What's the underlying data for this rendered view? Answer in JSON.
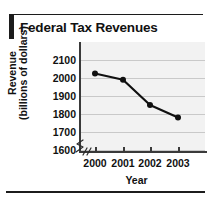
{
  "figure": {
    "title": "Federal Tax Revenues"
  },
  "chart_data": {
    "type": "line",
    "title": "Federal Tax Revenues",
    "xlabel": "Year",
    "ylabel": "Revenue (billions of dollars)",
    "ylabel_lines": [
      "Revenue",
      "(billions of dollars)"
    ],
    "categories": [
      "2000",
      "2001",
      "2002",
      "2003"
    ],
    "x": [
      2000,
      2001,
      2002,
      2003
    ],
    "values": [
      2025,
      1990,
      1850,
      1780
    ],
    "series": [
      {
        "name": "Federal Tax Revenues",
        "values": [
          2025,
          1990,
          1850,
          1780
        ]
      }
    ],
    "yticks": [
      1600,
      1700,
      1800,
      1900,
      2000,
      2100
    ],
    "ylim": [
      1550,
      2150
    ],
    "xlim": [
      1999.5,
      2003.5
    ],
    "grid": true,
    "grid_axis": "y",
    "legend": "none",
    "axis_break": "y-axis broken below 1600",
    "marker": "filled-circle",
    "line_color": "#101010",
    "marker_color": "#101010",
    "plot_background": "#f2f2f2",
    "gridline_color": "#c9c9c9"
  },
  "colors": {
    "ink": "#111111",
    "axis": "#3a3a3a",
    "grid": "#c9c9c9",
    "plot_bg": "#f2f2f2",
    "rule": "#1c1c1c"
  }
}
